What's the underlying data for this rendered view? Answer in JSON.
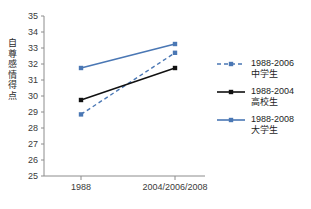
{
  "chart_data": {
    "type": "line",
    "title": "",
    "subtitle": "",
    "xlabel": "",
    "ylabel": "自尊感情得点",
    "categories": [
      "1988",
      "2004/2006/2008"
    ],
    "x_tick_labels": [
      "1988",
      "2004/2006/2008"
    ],
    "y_tick_labels": [
      "35",
      "34",
      "33",
      "32",
      "31",
      "30",
      "29",
      "28",
      "27",
      "26",
      "25"
    ],
    "ylim": [
      25,
      35
    ],
    "y_step": 1,
    "grid": false,
    "legend_position": "right",
    "series": [
      {
        "name": "1988-2006",
        "group": "中学生",
        "values": [
          28.85,
          32.7
        ],
        "color": "#4a77b4",
        "line_style": "dashed",
        "marker": "square"
      },
      {
        "name": "1988-2004",
        "group": "高校生",
        "values": [
          29.75,
          31.75
        ],
        "color": "#111111",
        "line_style": "solid",
        "marker": "square"
      },
      {
        "name": "1988-2008",
        "group": "大学生",
        "values": [
          31.75,
          33.25
        ],
        "color": "#4a77b4",
        "line_style": "solid",
        "marker": "square"
      }
    ]
  },
  "axis": {
    "y_label_chars": [
      "自",
      "尊",
      "感",
      "情",
      "得",
      "点"
    ]
  },
  "legend": {
    "items": [
      {
        "label": "1988-2006",
        "sublabel": "中学生",
        "color": "#4a77b4",
        "style": "dashed"
      },
      {
        "label": "1988-2004",
        "sublabel": "高校生",
        "color": "#111111",
        "style": "solid"
      },
      {
        "label": "1988-2008",
        "sublabel": "大学生",
        "color": "#4a77b4",
        "style": "solid"
      }
    ]
  },
  "caption": {
    "text": ""
  }
}
